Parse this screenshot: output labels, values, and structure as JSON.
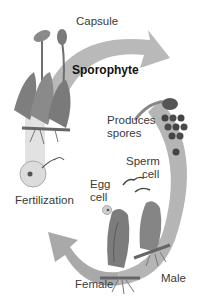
{
  "diagram": {
    "colors": {
      "arrow": "#b0b0b0",
      "arrow_light": "#d8d8d8",
      "plant": "#7d7d7d",
      "plant_dark": "#555555",
      "spore": "#4a4a4a",
      "background": "#ffffff"
    },
    "labels": {
      "capsule": "Capsule",
      "sporophyte": "Sporophyte",
      "produces_spores": "Produces\nspores",
      "sperm_cell": "Sperm\n     cell",
      "egg_cell": "Egg\ncell",
      "fertilization": "Fertilization",
      "female": "Female",
      "male": "Male"
    },
    "icons": [
      "capsule-plant-icon",
      "spore-cluster-icon",
      "sperm-icon",
      "egg-icon",
      "zygote-icon",
      "female-gametophyte-icon",
      "male-gametophyte-icon",
      "cycle-arrow-icon"
    ]
  }
}
